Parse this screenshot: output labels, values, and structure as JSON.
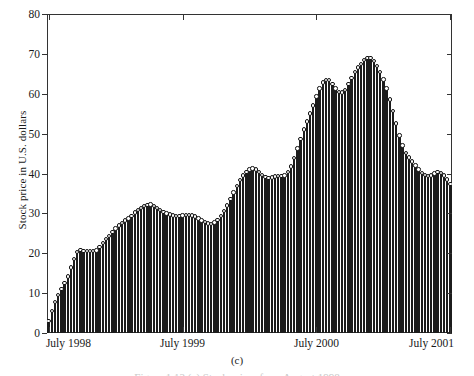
{
  "figure": {
    "panel_label": "(c)",
    "caption": "Figure 1.13  (c) Stock prices from August 1998"
  },
  "chart_data": {
    "type": "bar",
    "title": "",
    "subtitle": "",
    "xlabel": "",
    "ylabel": "Stock price in U.S. dollars",
    "ylim": [
      0,
      80
    ],
    "yticks": [
      0,
      10,
      20,
      30,
      40,
      50,
      60,
      70,
      80
    ],
    "ytick_labels": [
      "0",
      "10",
      "20",
      "30",
      "40",
      "50",
      "60",
      "70",
      "80"
    ],
    "xtick_labels": [
      "July 1998",
      "July 1999",
      "July 2000",
      "July 2001"
    ],
    "xtick_positions": [
      0,
      42,
      84,
      126
    ],
    "grid": false,
    "legend": null,
    "marker": "open-circle",
    "n_points": 127,
    "values": [
      3.0,
      5.5,
      7.8,
      9.5,
      11.0,
      12.6,
      14.2,
      16.4,
      18.6,
      20.3,
      20.8,
      20.6,
      20.5,
      20.6,
      20.5,
      20.7,
      21.6,
      22.6,
      23.5,
      24.4,
      25.3,
      26.2,
      27.0,
      27.6,
      28.2,
      28.7,
      29.4,
      30.2,
      30.9,
      31.4,
      31.8,
      32.1,
      32.2,
      31.9,
      31.4,
      30.9,
      30.4,
      30.0,
      29.7,
      29.5,
      29.4,
      29.4,
      29.5,
      29.6,
      29.6,
      29.5,
      29.2,
      28.7,
      28.2,
      27.8,
      27.5,
      27.4,
      27.7,
      28.4,
      29.4,
      30.6,
      32.0,
      33.6,
      35.2,
      36.8,
      38.3,
      39.5,
      40.4,
      41.0,
      41.3,
      41.0,
      40.3,
      39.6,
      39.1,
      38.9,
      39.0,
      39.2,
      39.3,
      39.3,
      39.5,
      40.3,
      41.8,
      43.9,
      46.3,
      48.7,
      51.0,
      53.0,
      55.0,
      57.1,
      59.3,
      61.3,
      62.8,
      63.5,
      63.4,
      62.5,
      61.3,
      60.5,
      60.3,
      61.0,
      62.4,
      64.0,
      65.5,
      66.6,
      67.5,
      68.4,
      69.0,
      68.9,
      68.2,
      67.0,
      65.5,
      63.6,
      61.3,
      58.6,
      55.6,
      52.5,
      49.5,
      47.0,
      45.2,
      44.0,
      43.0,
      42.0,
      41.0,
      40.2,
      39.6,
      39.3,
      39.5,
      40.0,
      40.3,
      40.1,
      39.5,
      38.5,
      37.3
    ]
  }
}
